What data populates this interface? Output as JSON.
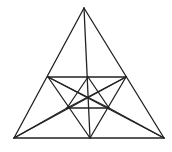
{
  "figure": {
    "title": "",
    "stroke_color": "#222222",
    "background": "#ffffff",
    "points": {
      "A": [
        84,
        8
      ],
      "BL": [
        14,
        138
      ],
      "BR": [
        164,
        138
      ],
      "BM": [
        90,
        138
      ],
      "P": [
        48,
        77
      ],
      "Q": [
        126,
        77
      ],
      "M": [
        88,
        77
      ],
      "L": [
        67,
        108
      ],
      "R": [
        109,
        108
      ]
    },
    "segments": [
      [
        "A",
        "BL"
      ],
      [
        "A",
        "BR"
      ],
      [
        "BL",
        "BR"
      ],
      [
        "A",
        "BM"
      ],
      [
        "P",
        "Q"
      ],
      [
        "L",
        "R"
      ],
      [
        "P",
        "BM"
      ],
      [
        "Q",
        "BM"
      ],
      [
        "P",
        "R"
      ],
      [
        "Q",
        "L"
      ],
      [
        "BL",
        "Q"
      ],
      [
        "BR",
        "P"
      ],
      [
        "M",
        "L"
      ],
      [
        "M",
        "R"
      ],
      [
        "BL",
        "L"
      ],
      [
        "BR",
        "R"
      ]
    ]
  }
}
